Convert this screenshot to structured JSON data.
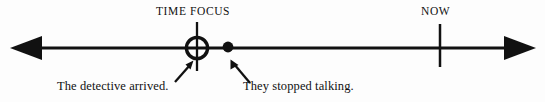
{
  "diagram": {
    "type": "timeline",
    "background_color": "#fdfdfd",
    "ink_color": "#111111",
    "axis": {
      "name": "time-axis",
      "y": 48,
      "x_start": 10,
      "x_end": 536,
      "thickness": 3,
      "arrow_left": true,
      "arrow_right": true,
      "arrowhead_length": 30,
      "arrowhead_half_height": 11
    },
    "markers": [
      {
        "id": "time-focus",
        "label": "TIME FOCUS",
        "label_x": 156,
        "label_y": 5,
        "x": 197,
        "glyph": "circle-open-with-tick",
        "circle_radius": 11,
        "circle_stroke": 3.2,
        "tick_top": 22,
        "tick_bottom": 71,
        "tick_thickness": 2.2
      },
      {
        "id": "event-dot",
        "label": "",
        "x": 228,
        "glyph": "dot-filled",
        "dot_radius": 5.5
      },
      {
        "id": "now",
        "label": "NOW",
        "label_x": 421,
        "label_y": 5,
        "x": 440,
        "glyph": "tick",
        "tick_top": 24,
        "tick_bottom": 67,
        "tick_thickness": 2.4
      }
    ],
    "annotations": [
      {
        "id": "detective-arrived",
        "text": "The detective arrived.",
        "text_x": 57,
        "text_y": 79,
        "pointer": {
          "name": "pointer-arrow-up-right",
          "tail_x": 174,
          "tail_y": 82,
          "head_x": 192,
          "head_y": 62
        }
      },
      {
        "id": "stopped-talking",
        "text": "They stopped talking.",
        "text_x": 243,
        "text_y": 79,
        "pointer": {
          "name": "pointer-arrow-up-left",
          "tail_x": 250,
          "tail_y": 83,
          "head_x": 231,
          "head_y": 61
        }
      }
    ]
  }
}
